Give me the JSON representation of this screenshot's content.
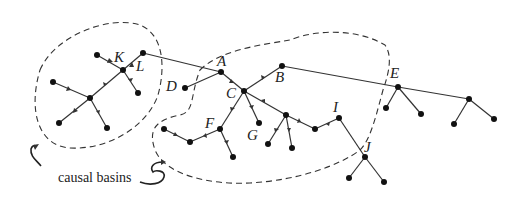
{
  "diagram": {
    "caption": "causal basins",
    "labels": {
      "K": "K",
      "L": "L",
      "A": "A",
      "B": "B",
      "C": "C",
      "D": "D",
      "E": "E",
      "F": "F",
      "G": "G",
      "I": "I",
      "J": "J"
    },
    "nodes": [
      {
        "id": "K_leaf",
        "x": 97,
        "y": 55
      },
      {
        "id": "L",
        "x": 143,
        "y": 53
      },
      {
        "id": "K",
        "x": 123,
        "y": 70
      },
      {
        "id": "K_r",
        "x": 138,
        "y": 93
      },
      {
        "id": "lft",
        "x": 53,
        "y": 82
      },
      {
        "id": "ctr",
        "x": 90,
        "y": 98
      },
      {
        "id": "bl",
        "x": 59,
        "y": 123
      },
      {
        "id": "bm",
        "x": 107,
        "y": 128
      },
      {
        "id": "A",
        "x": 221,
        "y": 72
      },
      {
        "id": "D",
        "x": 185,
        "y": 88
      },
      {
        "id": "C",
        "x": 244,
        "y": 91
      },
      {
        "id": "F",
        "x": 220,
        "y": 129
      },
      {
        "id": "fl",
        "x": 164,
        "y": 129
      },
      {
        "id": "fm",
        "x": 190,
        "y": 142
      },
      {
        "id": "fb",
        "x": 233,
        "y": 157
      },
      {
        "id": "G",
        "x": 259,
        "y": 123
      },
      {
        "id": "B",
        "x": 282,
        "y": 66
      },
      {
        "id": "H",
        "x": 286,
        "y": 115
      },
      {
        "id": "h1",
        "x": 268,
        "y": 144
      },
      {
        "id": "h2",
        "x": 292,
        "y": 148
      },
      {
        "id": "m",
        "x": 315,
        "y": 129
      },
      {
        "id": "I",
        "x": 339,
        "y": 118
      },
      {
        "id": "J",
        "x": 365,
        "y": 157
      },
      {
        "id": "j1",
        "x": 349,
        "y": 178
      },
      {
        "id": "j2",
        "x": 384,
        "y": 182
      },
      {
        "id": "E",
        "x": 398,
        "y": 87
      },
      {
        "id": "e1",
        "x": 386,
        "y": 108
      },
      {
        "id": "e2",
        "x": 421,
        "y": 114
      },
      {
        "id": "R",
        "x": 469,
        "y": 99
      },
      {
        "id": "r1",
        "x": 454,
        "y": 124
      },
      {
        "id": "r2",
        "x": 494,
        "y": 119
      }
    ],
    "edges": [
      [
        "K_leaf",
        "K"
      ],
      [
        "L",
        "K"
      ],
      [
        "K",
        "K_r"
      ],
      [
        "K",
        "ctr"
      ],
      [
        "lft",
        "ctr"
      ],
      [
        "ctr",
        "bl"
      ],
      [
        "ctr",
        "bm"
      ],
      [
        "L",
        "A"
      ],
      [
        "D",
        "A"
      ],
      [
        "A",
        "C"
      ],
      [
        "B",
        "C"
      ],
      [
        "C",
        "F"
      ],
      [
        "C",
        "G"
      ],
      [
        "C",
        "H"
      ],
      [
        "fl",
        "fm"
      ],
      [
        "F",
        "fm"
      ],
      [
        "F",
        "fb"
      ],
      [
        "H",
        "h1"
      ],
      [
        "H",
        "h2"
      ],
      [
        "H",
        "m"
      ],
      [
        "I",
        "m"
      ],
      [
        "I",
        "J"
      ],
      [
        "J",
        "j1"
      ],
      [
        "J",
        "j2"
      ],
      [
        "B",
        "E"
      ],
      [
        "E",
        "e1"
      ],
      [
        "E",
        "e2"
      ],
      [
        "E",
        "R"
      ],
      [
        "R",
        "r1"
      ],
      [
        "R",
        "r2"
      ]
    ]
  }
}
